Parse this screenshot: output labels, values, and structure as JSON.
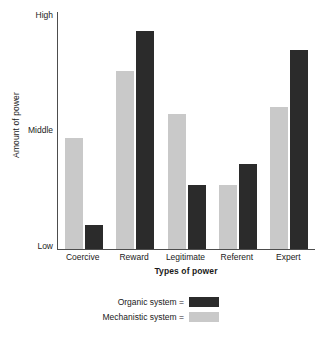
{
  "chart_data": {
    "type": "bar",
    "title": "",
    "xlabel": "Types of power",
    "ylabel": "Amount of power",
    "categories": [
      "Coercive",
      "Reward",
      "Legitimate",
      "Referent",
      "Expert"
    ],
    "ytick_labels": [
      "High",
      "Middle",
      "Low"
    ],
    "ytick_values": [
      100,
      50,
      0
    ],
    "ylim": [
      0,
      100
    ],
    "grid": false,
    "legend_position": "bottom-center",
    "series": [
      {
        "name": "Mechanistic system",
        "legend_label": "Mechanistic system =",
        "color": "#c9c9c9",
        "values": [
          47,
          75,
          57,
          27,
          60
        ]
      },
      {
        "name": "Organic system",
        "legend_label": "Organic system =",
        "color": "#2b2b2b",
        "values": [
          10,
          92,
          27,
          36,
          84
        ]
      }
    ],
    "series_order_in_group": [
      "Mechanistic system",
      "Organic system"
    ],
    "axis_color": "#4d4d4d",
    "background_color": "#ffffff"
  }
}
